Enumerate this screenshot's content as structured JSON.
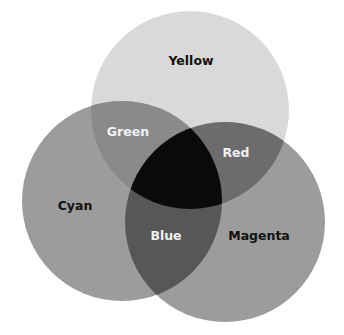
{
  "diagram": {
    "type": "venn",
    "circles": [
      {
        "name": "Yellow",
        "cx": 190,
        "cy": 110,
        "r": 99,
        "fill": "#d9d9d9"
      },
      {
        "name": "Cyan",
        "cx": 122,
        "cy": 201,
        "r": 100,
        "fill": "#9c9c9c"
      },
      {
        "name": "Magenta",
        "cx": 225,
        "cy": 222,
        "r": 100,
        "fill": "#9c9c9c"
      }
    ],
    "regions": {
      "green": "#8a8a8a",
      "red": "#6c6c6c",
      "blue": "#575757",
      "center": "#0a0a0a"
    },
    "labels": {
      "yellow": "Yellow",
      "green": "Green",
      "red": "Red",
      "cyan": "Cyan",
      "blue": "Blue",
      "magenta": "Magenta"
    }
  }
}
